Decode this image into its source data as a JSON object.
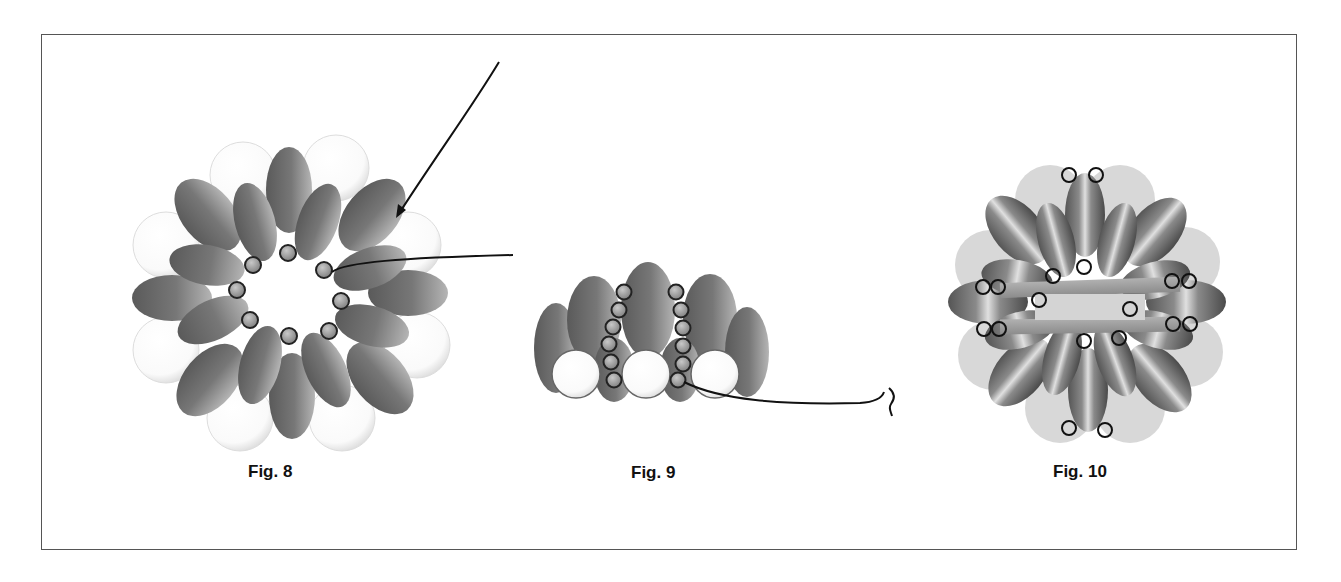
{
  "figures": [
    {
      "id": "fig8",
      "caption": "Fig. 8",
      "description": "Ring of dagger/drop beads with seed beads in center and large round beads behind; two thread paths with arrow"
    },
    {
      "id": "fig9",
      "caption": "Fig. 9",
      "description": "Side view: drop beads with two columns of six seed beads and three large white rounds; thread exits to the right"
    },
    {
      "id": "fig10",
      "caption": "Fig. 10",
      "description": "Finished component: ring of striped drop beads over light round beads with two horizontal bars and seed beads"
    }
  ],
  "colors": {
    "drop_bead": "#6e6e6e",
    "drop_bead_light": "#a8a8a8",
    "round_bead": "#ffffff",
    "round_bead_fig10": "#d6d6d6",
    "seed_bead": "#9a9a9a",
    "thread": "#111111",
    "frame": "#555555"
  }
}
